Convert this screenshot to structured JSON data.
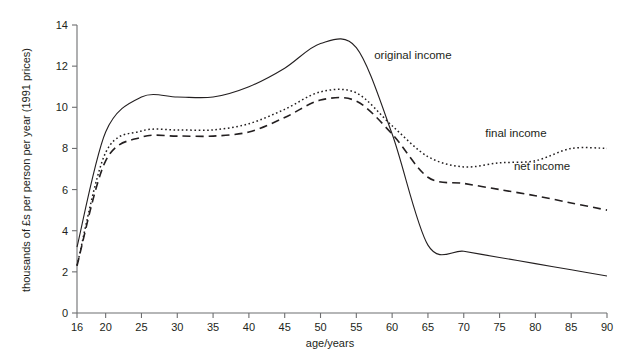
{
  "chart_data": {
    "type": "line",
    "title": "",
    "xlabel": "age/years",
    "ylabel": "thousands of £s per person per year (1991 prices)",
    "xlim": [
      16,
      90
    ],
    "ylim": [
      0,
      14
    ],
    "grid": false,
    "legend_position": "inline-annotations",
    "xticks": [
      "16",
      "20",
      "25",
      "30",
      "35",
      "40",
      "45",
      "50",
      "55",
      "60",
      "65",
      "70",
      "75",
      "80",
      "85",
      "90"
    ],
    "xtick_values": [
      16,
      20,
      25,
      30,
      35,
      40,
      45,
      50,
      55,
      60,
      65,
      70,
      75,
      80,
      85,
      90
    ],
    "yticks": [
      "0",
      "2",
      "4",
      "6",
      "8",
      "10",
      "12",
      "14"
    ],
    "ytick_values": [
      0,
      2,
      4,
      6,
      8,
      10,
      12,
      14
    ],
    "x": [
      16,
      20,
      25,
      30,
      35,
      40,
      45,
      50,
      55,
      60,
      65,
      70,
      75,
      80,
      85,
      90
    ],
    "series": [
      {
        "name": "original income",
        "style": "solid",
        "color": "#231f20",
        "values": [
          3.2,
          8.8,
          10.5,
          10.5,
          10.5,
          11.0,
          11.9,
          13.1,
          12.9,
          8.7,
          3.3,
          3.0,
          2.7,
          2.4,
          2.1,
          1.8
        ]
      },
      {
        "name": "final income",
        "style": "dotted",
        "color": "#231f20",
        "values": [
          2.3,
          7.8,
          8.85,
          8.9,
          8.9,
          9.2,
          9.9,
          10.75,
          10.7,
          9.1,
          7.6,
          7.1,
          7.3,
          7.4,
          8.0,
          8.0
        ]
      },
      {
        "name": "net income",
        "style": "dashed",
        "color": "#231f20",
        "values": [
          2.3,
          7.4,
          8.55,
          8.6,
          8.6,
          8.8,
          9.5,
          10.35,
          10.3,
          8.7,
          6.6,
          6.3,
          6.0,
          5.7,
          5.35,
          5.0
        ]
      }
    ],
    "annotations": [
      {
        "text": "original income",
        "x": 57.5,
        "y": 12.35
      },
      {
        "text": "final income",
        "x": 73.0,
        "y": 8.55
      },
      {
        "text": "net income",
        "x": 77.0,
        "y": 6.95
      }
    ]
  },
  "axis": {
    "x_title": "age/years",
    "y_title": "thousands of £s per person per year (1991 prices)"
  }
}
